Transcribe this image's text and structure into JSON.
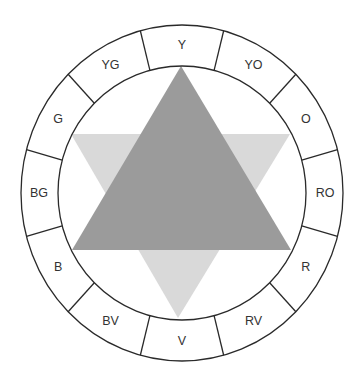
{
  "diagram": {
    "type": "color-wheel",
    "center": {
      "x": 182,
      "y": 193
    },
    "outer_radius": {
      "rx": 161,
      "ry": 168
    },
    "inner_radius": {
      "rx": 124,
      "ry": 127
    },
    "label_radius": {
      "rx": 143,
      "ry": 148
    },
    "segment_count": 12,
    "segments": [
      {
        "label": "Y"
      },
      {
        "label": "YO"
      },
      {
        "label": "O"
      },
      {
        "label": "RO"
      },
      {
        "label": "R"
      },
      {
        "label": "RV"
      },
      {
        "label": "V"
      },
      {
        "label": "BV"
      },
      {
        "label": "B"
      },
      {
        "label": "BG"
      },
      {
        "label": "G"
      },
      {
        "label": "YG"
      }
    ],
    "triangles": [
      {
        "name": "light-triangle-pointing-down",
        "color": "#d9d9d9",
        "points": [
          [
            71,
            134
          ],
          [
            290,
            134
          ],
          [
            178,
            318
          ]
        ]
      },
      {
        "name": "dark-triangle-pointing-up",
        "color": "#9b9b9b",
        "points": [
          [
            181,
            66
          ],
          [
            291,
            250
          ],
          [
            72,
            250
          ]
        ]
      }
    ],
    "colors": {
      "line": "#2a2a2a",
      "text": "#333333",
      "background": "#ffffff"
    }
  }
}
